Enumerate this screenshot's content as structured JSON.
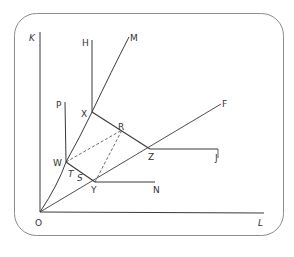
{
  "diagram": {
    "frame_color": "#8c8c8c",
    "line_color": "#3a3a3a",
    "labels": {
      "K": "K",
      "L": "L",
      "O": "O",
      "H": "H",
      "M": "M",
      "P": "P",
      "X": "X",
      "R": "R",
      "F": "F",
      "W": "W",
      "Z": "Z",
      "J": "J",
      "T": "T",
      "S": "S",
      "Y": "Y",
      "N": "N"
    },
    "points": {
      "O": [
        40,
        212
      ],
      "W": [
        66,
        162
      ],
      "X": [
        92,
        112
      ],
      "R": [
        122,
        130
      ],
      "Z": [
        150,
        149
      ],
      "Y": [
        95,
        182
      ]
    },
    "caption": "Figure 5.5.2 (partially hidden)"
  }
}
